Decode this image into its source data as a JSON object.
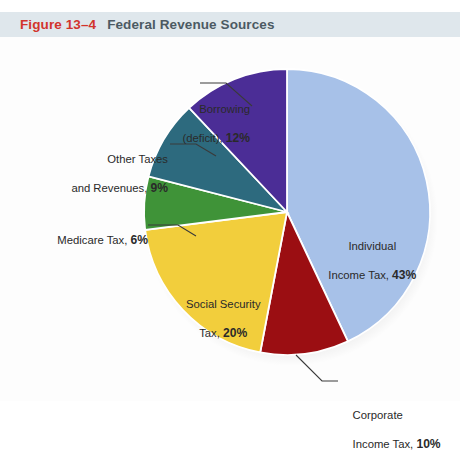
{
  "header": {
    "figure_number": "Figure 13–4",
    "title": "Federal Revenue Sources",
    "band_color": "#dfe7ec",
    "number_color": "#d2342c",
    "title_color": "#4c5a63"
  },
  "chart_data": {
    "type": "pie",
    "title": "Federal Revenue Sources",
    "xlabel": "",
    "ylabel": "",
    "units": "percent",
    "total": 100,
    "start_angle_deg": 0,
    "direction": "clockwise",
    "legend": "none-labels-attached",
    "grid": false,
    "categories": [
      "Individual Income Tax",
      "Corporate Income Tax",
      "Social Security Tax",
      "Medicare Tax",
      "Other Taxes and Revenues",
      "Borrowing (deficit)"
    ],
    "values": [
      43,
      10,
      20,
      6,
      9,
      12
    ],
    "colors": [
      "#a7c1e8",
      "#9b0e12",
      "#f2ce3c",
      "#3f9338",
      "#2d6a7e",
      "#4b2d96"
    ],
    "slices": [
      {
        "name": "Individual Income Tax",
        "value": 43,
        "color": "#a7c1e8",
        "label_line1": "Individual",
        "label_line2": "Income Tax, ",
        "label_pct": "43%",
        "label_placement": "inside",
        "leader_line": false
      },
      {
        "name": "Corporate Income Tax",
        "value": 10,
        "color": "#9b0e12",
        "label_line1": "Corporate",
        "label_line2": "Income Tax, ",
        "label_pct": "10%",
        "label_placement": "outside-bottom-right",
        "leader_line": true
      },
      {
        "name": "Social Security Tax",
        "value": 20,
        "color": "#f2ce3c",
        "label_line1": "Social Security",
        "label_line2": "Tax, ",
        "label_pct": "20%",
        "label_placement": "inside",
        "leader_line": false
      },
      {
        "name": "Medicare Tax",
        "value": 6,
        "color": "#3f9338",
        "label_line1": "",
        "label_line2": "Medicare Tax, ",
        "label_pct": "6%",
        "label_placement": "outside-left",
        "leader_line": true
      },
      {
        "name": "Other Taxes and Revenues",
        "value": 9,
        "color": "#2d6a7e",
        "label_line1": "Other Taxes",
        "label_line2": "and Revenues, ",
        "label_pct": "9%",
        "label_placement": "outside-left",
        "leader_line": true
      },
      {
        "name": "Borrowing (deficit)",
        "value": 12,
        "color": "#4b2d96",
        "label_line1": "Borrowing",
        "label_line2": "(deficit), ",
        "label_pct": "12%",
        "label_placement": "outside-top-left",
        "leader_line": true
      }
    ]
  },
  "geometry": {
    "center_x": 287,
    "center_y": 175,
    "radius": 143,
    "separator_color": "#ffffff",
    "leader_color": "#3a3a3a",
    "background": "#fdfdfd"
  }
}
